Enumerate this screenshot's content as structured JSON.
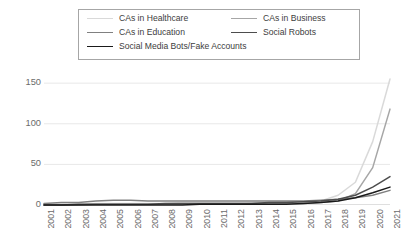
{
  "chart_data": {
    "type": "line",
    "title": "",
    "xlabel": "",
    "ylabel": "",
    "x": [
      "2001",
      "2002",
      "2003",
      "2004",
      "2005",
      "2006",
      "2007",
      "2008",
      "2009",
      "2010",
      "2011",
      "2012",
      "2013",
      "2014",
      "2015",
      "2016",
      "2017",
      "2018",
      "2019",
      "2020",
      "2021"
    ],
    "ylim": [
      0,
      160
    ],
    "yticks": [
      0,
      50,
      100,
      150
    ],
    "ytick_labels": [
      "0",
      "50",
      "100",
      "150"
    ],
    "xlim_categories": 21,
    "grid": "horizontal",
    "legend_position": "top",
    "series": [
      {
        "name": "CAs in Healthcare",
        "color": "#d9d9d9",
        "values": [
          1,
          1,
          1,
          2,
          2,
          2,
          2,
          2,
          3,
          3,
          3,
          3,
          3,
          3,
          4,
          4,
          5,
          12,
          28,
          78,
          155
        ]
      },
      {
        "name": "CAs in Business",
        "color": "#a6a6a6",
        "values": [
          0,
          0,
          0,
          1,
          1,
          1,
          1,
          1,
          1,
          1,
          1,
          1,
          2,
          2,
          2,
          2,
          3,
          5,
          14,
          46,
          118
        ]
      },
      {
        "name": "CAs in Education",
        "color": "#808080",
        "values": [
          2,
          3,
          3,
          5,
          6,
          6,
          5,
          5,
          5,
          5,
          5,
          5,
          5,
          5,
          5,
          5,
          6,
          7,
          9,
          12,
          18
        ]
      },
      {
        "name": "Social Robots",
        "color": "#4d4d4d",
        "values": [
          0,
          0,
          1,
          1,
          1,
          1,
          1,
          2,
          2,
          2,
          2,
          2,
          2,
          3,
          3,
          4,
          5,
          7,
          12,
          22,
          35
        ]
      },
      {
        "name": "Social Media Bots/Fake Accounts",
        "color": "#1a1a1a",
        "values": [
          0,
          0,
          0,
          0,
          0,
          0,
          0,
          0,
          0,
          1,
          1,
          1,
          1,
          1,
          1,
          2,
          3,
          5,
          9,
          15,
          22
        ]
      }
    ],
    "legend_layout": [
      {
        "series_index": 0,
        "col": 0,
        "row": 0
      },
      {
        "series_index": 1,
        "col": 1,
        "row": 0
      },
      {
        "series_index": 2,
        "col": 0,
        "row": 1
      },
      {
        "series_index": 3,
        "col": 1,
        "row": 1
      },
      {
        "series_index": 4,
        "col": 0,
        "row": 2
      }
    ]
  }
}
